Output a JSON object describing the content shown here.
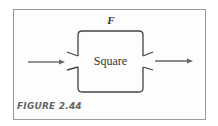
{
  "figure": {
    "function_label": "F",
    "box_label": "Square",
    "caption": "FIGURE 2.44",
    "colors": {
      "line": "#444444",
      "arrow": "#666666",
      "frame": "#9a9a9a",
      "caption": "#666666"
    },
    "elements": {
      "input_arrow": "arrow pointing into box from left",
      "output_arrow": "arrow pointing out of box to right",
      "input_port": "funnel-shaped opening on left side",
      "output_port": "funnel-shaped opening on right side"
    }
  }
}
